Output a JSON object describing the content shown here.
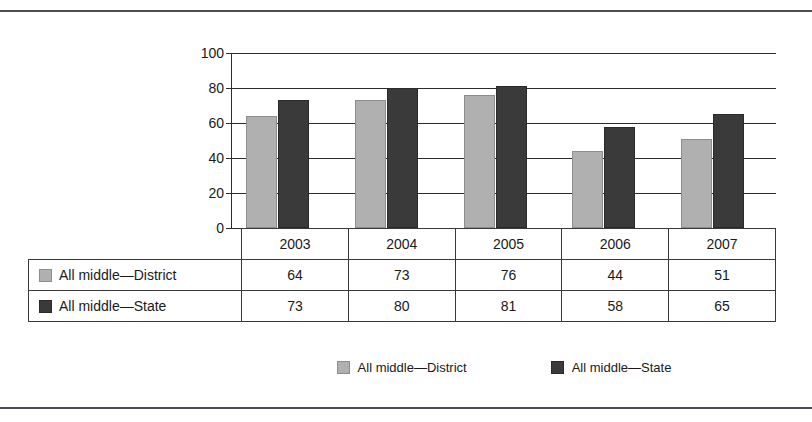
{
  "chart_data": {
    "type": "bar",
    "title": "",
    "xlabel": "",
    "ylabel": "",
    "categories": [
      "2003",
      "2004",
      "2005",
      "2006",
      "2007"
    ],
    "series": [
      {
        "name": "All middle—District",
        "color": "#b0b0b0",
        "values": [
          64,
          73,
          76,
          44,
          51
        ]
      },
      {
        "name": "All middle—State",
        "color": "#3a3a3a",
        "values": [
          73,
          80,
          81,
          58,
          65
        ]
      }
    ],
    "ylim": [
      0,
      100
    ],
    "yticks": [
      "0",
      "20",
      "40",
      "60",
      "80",
      "100"
    ],
    "grid": true,
    "legend_position": "bottom"
  },
  "table": {
    "year_header": [
      "2003",
      "2004",
      "2005",
      "2006",
      "2007"
    ],
    "rows": [
      {
        "label": "All middle—District",
        "swatch": "light-swatch",
        "values": [
          "64",
          "73",
          "76",
          "44",
          "51"
        ]
      },
      {
        "label": "All middle—State",
        "swatch": "dark-swatch",
        "values": [
          "73",
          "80",
          "81",
          "58",
          "65"
        ]
      }
    ]
  },
  "legend": {
    "items": [
      {
        "label": "All middle—District",
        "swatch": "light-swatch"
      },
      {
        "label": "All middle—State",
        "swatch": "dark-swatch"
      }
    ]
  }
}
